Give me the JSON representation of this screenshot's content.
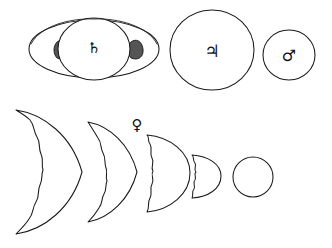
{
  "plate": {
    "title": "Telescopic appearances of the planets",
    "background_color": "#ffffff",
    "ink_color": "#1a1a1a",
    "shade_color": "#555555",
    "width": 332,
    "height": 248
  },
  "top_row": {
    "label": "Superior planets as seen through the telescope",
    "figures": [
      {
        "name": "saturn",
        "planet_label": "Saturn",
        "glyph": "♄",
        "glyph_name": "saturn-symbol",
        "has_ring": true,
        "ring_shading": "shaded ansae where ring crosses globe",
        "cx": 94,
        "cy": 49,
        "disc_rx": 36,
        "disc_ry": 31,
        "ring_rx": 65,
        "ring_ry": 29
      },
      {
        "name": "jupiter",
        "planet_label": "Jupiter",
        "glyph": "♃",
        "glyph_name": "jupiter-symbol",
        "has_ring": false,
        "cx": 212,
        "cy": 50,
        "disc_rx": 42,
        "disc_ry": 40
      },
      {
        "name": "mars",
        "planet_label": "Mars",
        "glyph": "♂",
        "glyph_name": "mars-symbol",
        "has_ring": false,
        "cx": 289,
        "cy": 55,
        "disc_rx": 26,
        "disc_ry": 25
      }
    ]
  },
  "bottom_row": {
    "label": "Phases of Venus",
    "glyph": "♀",
    "glyph_name": "venus-symbol",
    "glyph_x": 137,
    "glyph_y": 125,
    "phases": [
      {
        "name": "venus-phase-1",
        "phase_label": "thin crescent",
        "illumination_percent": 12,
        "apparent_size": "largest",
        "cx": 52,
        "cy": 172,
        "radius": 62
      },
      {
        "name": "venus-phase-2",
        "phase_label": "crescent",
        "illumination_percent": 25,
        "apparent_size": "large",
        "cx": 116,
        "cy": 172,
        "radius": 50
      },
      {
        "name": "venus-phase-3",
        "phase_label": "half (dichotomy)",
        "illumination_percent": 50,
        "apparent_size": "medium",
        "cx": 170,
        "cy": 173,
        "radius": 38
      },
      {
        "name": "venus-phase-4",
        "phase_label": "half, smaller",
        "illumination_percent": 50,
        "apparent_size": "small",
        "cx": 208,
        "cy": 176,
        "radius": 24
      },
      {
        "name": "venus-phase-5",
        "phase_label": "full disc",
        "illumination_percent": 100,
        "apparent_size": "smallest",
        "cx": 253,
        "cy": 177,
        "radius": 20
      }
    ]
  }
}
